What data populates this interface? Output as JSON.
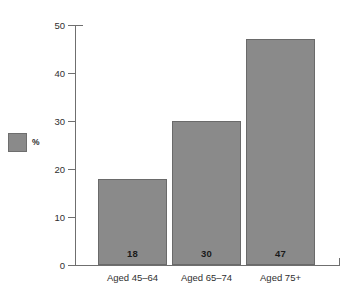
{
  "chart_data": {
    "type": "bar",
    "title": "",
    "subtitle": "",
    "xlabel": "",
    "ylabel": "",
    "categories": [
      "Aged 45–64",
      "Aged 65–74",
      "Aged 75+"
    ],
    "values": [
      18,
      30,
      47
    ],
    "value_labels": [
      "18",
      "30",
      "47"
    ],
    "series": [
      {
        "name": "%",
        "values": [
          18,
          30,
          47
        ]
      }
    ],
    "ylim": [
      0,
      50
    ],
    "ytick_labels": [
      "0",
      "10",
      "20",
      "30",
      "40",
      "50"
    ],
    "ytick_values": [
      0,
      10,
      20,
      30,
      40,
      50
    ],
    "grid": false,
    "legend": {
      "position": "left-middle",
      "entries": [
        {
          "label": "%",
          "color": "#8a8a8a"
        }
      ]
    },
    "colors": {
      "bar_fill": "#8a8a8a",
      "bar_stroke": "#6a6a6a",
      "axis": "#6f6f6f",
      "text": "#2f2f2f",
      "value_text": "#1a1a1a",
      "background": "#ffffff"
    }
  }
}
